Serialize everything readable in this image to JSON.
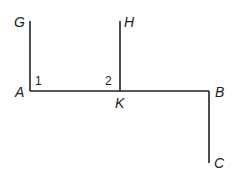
{
  "diagram": {
    "points": {
      "G": {
        "label": "G",
        "x": 30,
        "y": 21
      },
      "H": {
        "label": "H",
        "x": 120,
        "y": 21
      },
      "A": {
        "label": "A",
        "x": 30,
        "y": 91
      },
      "K": {
        "label": "K",
        "x": 120,
        "y": 91
      },
      "B": {
        "label": "B",
        "x": 209,
        "y": 91
      },
      "C": {
        "label": "C",
        "x": 209,
        "y": 163
      }
    },
    "segments": [
      {
        "from": "G",
        "to": "A"
      },
      {
        "from": "H",
        "to": "K"
      },
      {
        "from": "A",
        "to": "B"
      },
      {
        "from": "B",
        "to": "C"
      }
    ],
    "angles": [
      {
        "label": "1",
        "vertex": "A"
      },
      {
        "label": "2",
        "vertex": "K"
      }
    ],
    "line_color": "#222222"
  }
}
